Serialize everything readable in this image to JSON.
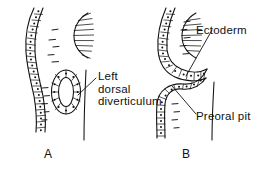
{
  "figure": {
    "type": "biological-line-drawing",
    "ink_color": "#111111",
    "background_color": "#ffffff"
  },
  "panels": [
    {
      "id": "A",
      "letter": "A",
      "labels": [
        {
          "name": "left-dorsal-diverticulum",
          "lines": [
            "Left",
            "dorsal",
            "diverticulum"
          ]
        }
      ]
    },
    {
      "id": "B",
      "letter": "B",
      "labels": [
        {
          "name": "ectoderm",
          "lines": [
            "Ectoderm"
          ]
        },
        {
          "name": "preoral-pit",
          "lines": [
            "Preoral pit"
          ]
        }
      ]
    }
  ],
  "labels": {
    "left_dorsal_line1": "Left",
    "left_dorsal_line2": "dorsal",
    "left_dorsal_line3": "diverticulum",
    "ectoderm": "Ectoderm",
    "preoral_pit": "Preoral pit",
    "panel_a": "A",
    "panel_b": "B"
  }
}
